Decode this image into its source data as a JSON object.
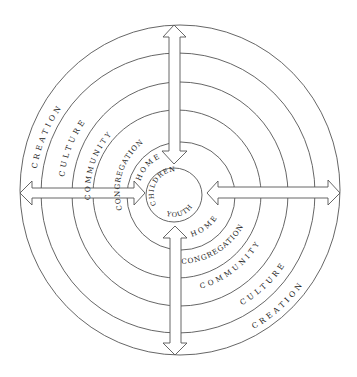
{
  "diagram": {
    "type": "concentric-circles",
    "center_label_top": "CHILDREN",
    "center_label_bottom": "YOUTH",
    "rings_inner_to_outer": [
      "HOME",
      "CONGREGATION",
      "COMMUNITY",
      "CULTURE",
      "CREATION"
    ],
    "upper_left_labels": {
      "creation": "CREATION",
      "culture": "CULTURE",
      "community": "COMMUNITY",
      "congregation": "CONGREGATION",
      "home": "HOME",
      "children": "CHILDREN"
    },
    "lower_right_labels": {
      "youth": "YOUTH",
      "home": "HOME",
      "congregation": "CONGREGATION",
      "community": "COMMUNITY",
      "culture": "CULTURE",
      "creation": "CREATION"
    },
    "arrows": [
      {
        "name": "top",
        "direction": "bidirectional-vertical"
      },
      {
        "name": "bottom",
        "direction": "bidirectional-vertical"
      },
      {
        "name": "left",
        "direction": "bidirectional-horizontal"
      },
      {
        "name": "right",
        "direction": "bidirectional-horizontal"
      }
    ],
    "colors": {
      "stroke": "#555555",
      "text": "#222222",
      "background": "#ffffff"
    }
  }
}
